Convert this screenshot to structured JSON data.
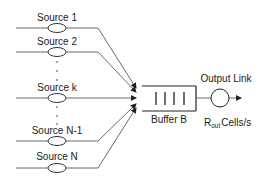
{
  "diagram": {
    "sources": [
      {
        "label": "Source 1",
        "y": 28,
        "target_y": 88
      },
      {
        "label": "Source 2",
        "y": 52,
        "target_y": 92
      },
      {
        "label": "Source k",
        "y": 98,
        "target_y": 98
      },
      {
        "label": "Source N-1",
        "y": 141,
        "target_y": 104
      },
      {
        "label": "Source N",
        "y": 168,
        "target_y": 108
      }
    ],
    "buffer": {
      "label": "Buffer B"
    },
    "output": {
      "label": "Output Link",
      "rate_symbol": "R",
      "rate_subscript": "out",
      "rate_unit": "Cells/s"
    },
    "colors": {
      "line": "#333333",
      "text": "#222222",
      "background": "#ffffff"
    }
  }
}
